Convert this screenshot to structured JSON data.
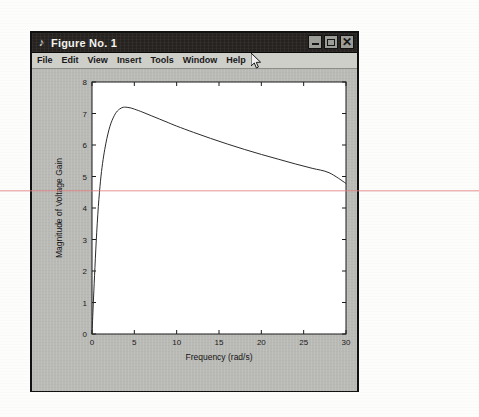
{
  "window": {
    "title": "Figure No. 1",
    "title_icon": "figure-note-icon",
    "controls": {
      "minimize_label": "_",
      "maximize_label": "□",
      "close_label": "×"
    }
  },
  "menu": {
    "items": [
      {
        "label": "File"
      },
      {
        "label": "Edit"
      },
      {
        "label": "View"
      },
      {
        "label": "Insert"
      },
      {
        "label": "Tools"
      },
      {
        "label": "Window"
      },
      {
        "label": "Help"
      }
    ]
  },
  "cursor": {
    "name": "mouse-pointer",
    "x": 253,
    "y": 57
  },
  "colors": {
    "title_bar": "#26221f",
    "menu_bar": "#cfcfca",
    "figure_background": "#b9b9b5",
    "axes_background": "#ffffff",
    "curve": "#2b2b2b",
    "scan_artifact": "#e27878"
  },
  "chart_data": {
    "type": "line",
    "title": "",
    "xlabel": "Frequency (rad/s)",
    "ylabel": "Magnitude of Voltage Gain",
    "xlim": [
      0,
      30
    ],
    "ylim": [
      0,
      8
    ],
    "xticks": [
      0,
      5,
      10,
      15,
      20,
      25,
      30
    ],
    "yticks": [
      0,
      1,
      2,
      3,
      4,
      5,
      6,
      7,
      8
    ],
    "grid": false,
    "legend": null,
    "series": [
      {
        "name": "Voltage Gain Magnitude",
        "color": "#2b2b2b",
        "x": [
          0,
          0.15,
          0.3,
          0.5,
          0.75,
          1.0,
          1.25,
          1.5,
          1.75,
          2.0,
          2.25,
          2.5,
          2.75,
          3.0,
          3.25,
          3.5,
          3.75,
          4.0,
          4.5,
          5.0,
          6.0,
          7.0,
          8.0,
          9.0,
          10.0,
          12.0,
          14.0,
          16.0,
          18.0,
          20.0,
          22.0,
          24.0,
          26.0,
          28.0,
          30.0
        ],
        "y": [
          0.0,
          0.95,
          1.85,
          2.95,
          4.05,
          4.85,
          5.42,
          5.85,
          6.2,
          6.48,
          6.7,
          6.86,
          6.99,
          7.08,
          7.14,
          7.18,
          7.2,
          7.2,
          7.18,
          7.14,
          7.04,
          6.93,
          6.82,
          6.71,
          6.6,
          6.4,
          6.21,
          6.03,
          5.86,
          5.7,
          5.55,
          5.4,
          5.26,
          5.12,
          4.78
        ]
      }
    ]
  }
}
